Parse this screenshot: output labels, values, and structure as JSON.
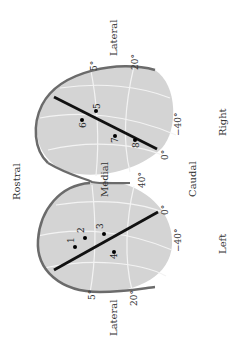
{
  "figure": {
    "orientation_note_visible": "rotated 90 degrees clockwise",
    "labels": {
      "rostral": "Rostral",
      "caudal": "Caudal",
      "medial": "Medial",
      "lateral_right": "Lateral",
      "lateral_left": "Lateral",
      "right": "Right",
      "left": "Left"
    },
    "right_hemisphere": {
      "degree_labels": [
        "5°",
        "20°",
        "−40°",
        "0°"
      ],
      "points": [
        {
          "id": "5",
          "label": "5"
        },
        {
          "id": "6",
          "label": "6"
        },
        {
          "id": "7",
          "label": "7"
        },
        {
          "id": "8",
          "label": "8"
        }
      ]
    },
    "left_hemisphere": {
      "degree_labels": [
        "5°",
        "20°",
        "−40°",
        "0°",
        "40°"
      ],
      "points": [
        {
          "id": "1",
          "label": "1"
        },
        {
          "id": "2",
          "label": "2"
        },
        {
          "id": "3",
          "label": "3"
        },
        {
          "id": "4",
          "label": "4"
        }
      ]
    },
    "colors": {
      "fill": "#d4d4d4",
      "outline": "#6b6b6b",
      "grid": "#f2f2f2",
      "line": "#111111"
    }
  }
}
